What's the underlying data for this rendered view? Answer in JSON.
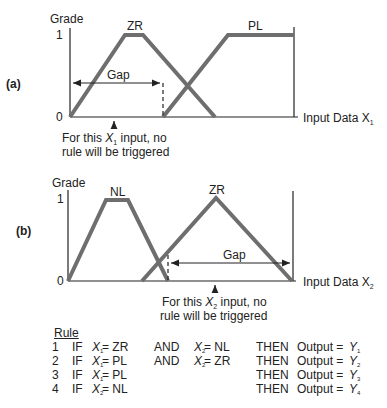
{
  "panels": [
    {
      "id": "a",
      "panel_label": "(a)",
      "y_axis_label": "Grade",
      "y_tick_high": "1",
      "y_tick_low": "0",
      "x_axis_label": "Input Data X",
      "x_axis_sub": "1",
      "gap_label": "Gap",
      "sets": [
        {
          "name": "ZR",
          "shape": "trapezoid",
          "points": [
            0,
            0.25,
            0.33,
            0.65
          ]
        },
        {
          "name": "PL",
          "shape": "trapezoid-open-right",
          "points": [
            0.42,
            0.71,
            1.0,
            1.0
          ]
        }
      ],
      "note_line1_pre": "For this ",
      "note_var": "X",
      "note_sub": "1",
      "note_line1_post": " input, no",
      "note_line2": "rule will be triggered"
    },
    {
      "id": "b",
      "panel_label": "(b)",
      "y_axis_label": "Grade",
      "y_tick_high": "1",
      "y_tick_low": "0",
      "x_axis_label": "Input Data X",
      "x_axis_sub": "2",
      "gap_label": "Gap",
      "sets": [
        {
          "name": "NL",
          "shape": "trapezoid",
          "points": [
            0,
            0.17,
            0.27,
            0.44
          ]
        },
        {
          "name": "ZR",
          "shape": "triangle",
          "points": [
            0.33,
            0.66,
            1.0
          ]
        }
      ],
      "note_line1_pre": "For this ",
      "note_var": "X",
      "note_sub": "2",
      "note_line1_post": " input, no",
      "note_line2": "rule will be triggered"
    }
  ],
  "rules": {
    "header": "Rule",
    "rows": [
      {
        "num": "1",
        "if": "IF",
        "v1": "X",
        "s1": "1",
        "c1": "= ZR",
        "and": "AND",
        "v2": "X",
        "s2": "2",
        "c2": "= NL",
        "then": "THEN",
        "out": "Output =",
        "y": "Y",
        "ys": "1"
      },
      {
        "num": "2",
        "if": "IF",
        "v1": "X",
        "s1": "1",
        "c1": "= PL",
        "and": "AND",
        "v2": "X",
        "s2": "2",
        "c2": "= ZR",
        "then": "THEN",
        "out": "Output =",
        "y": "Y",
        "ys": "2"
      },
      {
        "num": "3",
        "if": "IF",
        "v1": "X",
        "s1": "1",
        "c1": "= PL",
        "and": "",
        "v2": "",
        "s2": "",
        "c2": "",
        "then": "THEN",
        "out": "Output =",
        "y": "Y",
        "ys": "3"
      },
      {
        "num": "4",
        "if": "IF",
        "v1": "X",
        "s1": "2",
        "c1": "= NL",
        "and": "",
        "v2": "",
        "s2": "",
        "c2": "",
        "then": "THEN",
        "out": "Output =",
        "y": "Y",
        "ys": "4"
      }
    ]
  },
  "colors": {
    "membership": "#6e6e6e",
    "axis": "#222222"
  }
}
